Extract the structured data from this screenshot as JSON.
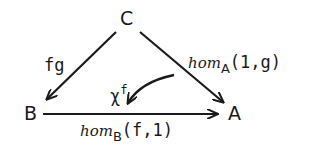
{
  "nodes": {
    "C": "C",
    "B": "B",
    "A": "A"
  },
  "arrows": {
    "fg": {
      "label": "fg",
      "from": "C",
      "to": "B"
    },
    "hom_A": {
      "name": "hom",
      "subscript": "A",
      "args": "(1,g)",
      "from": "C",
      "to": "A"
    },
    "hom_B": {
      "name": "hom",
      "subscript": "B",
      "args": "(f,1)",
      "from": "B",
      "to": "A"
    },
    "chi": {
      "base": "χ",
      "superscript": "f",
      "type": "2-cell curved arrow"
    }
  }
}
